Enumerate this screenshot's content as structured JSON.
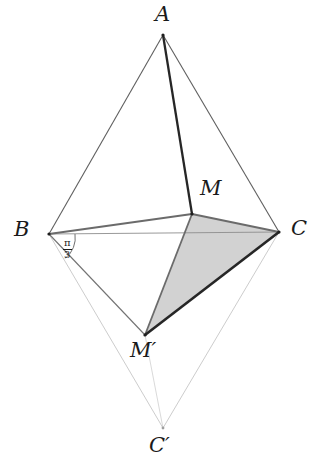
{
  "figure": {
    "type": "geometry-diagram",
    "title": "",
    "background_color": "#ffffff"
  },
  "labels": {
    "A": "A",
    "B": "B",
    "C": "C",
    "M": "M",
    "M_prime": "M′",
    "C_prime": "C′"
  },
  "angle": {
    "numerator": "π",
    "denominator": "3",
    "at_vertex": "B"
  },
  "points": {
    "A": {
      "x": 163,
      "y": 35
    },
    "B": {
      "x": 49,
      "y": 234
    },
    "C": {
      "x": 279,
      "y": 232
    },
    "M": {
      "x": 192,
      "y": 214
    },
    "Mp": {
      "x": 145,
      "y": 335
    },
    "Cp": {
      "x": 163,
      "y": 428
    }
  },
  "label_positions": {
    "A": {
      "x": 155,
      "y": 4
    },
    "B": {
      "x": 14,
      "y": 219
    },
    "C": {
      "x": 291,
      "y": 218
    },
    "M": {
      "x": 200,
      "y": 178
    },
    "Mp": {
      "x": 130,
      "y": 340
    },
    "Cp": {
      "x": 149,
      "y": 435
    },
    "frac": {
      "x": 63,
      "y": 238
    }
  },
  "colors": {
    "shade_fill": "#d2d2d2",
    "stroke_dark": "#262626",
    "stroke_mid": "#6e6e6e",
    "stroke_light": "#9a9a9a",
    "stroke_faint": "#c2c2c2",
    "text": "#1a1a1a"
  },
  "edges": [
    {
      "name": "A-B",
      "from": "A",
      "to": "B",
      "weight": "thin",
      "tone": "mid"
    },
    {
      "name": "A-C",
      "from": "A",
      "to": "C",
      "weight": "thin",
      "tone": "mid"
    },
    {
      "name": "A-M",
      "from": "A",
      "to": "M",
      "weight": "thick",
      "tone": "dark"
    },
    {
      "name": "B-C",
      "from": "B",
      "to": "C",
      "weight": "hair",
      "tone": "light"
    },
    {
      "name": "B-M",
      "from": "B",
      "to": "M",
      "weight": "medium",
      "tone": "mid"
    },
    {
      "name": "M-C",
      "from": "M",
      "to": "C",
      "weight": "medium",
      "tone": "mid"
    },
    {
      "name": "B-Mp",
      "from": "B",
      "to": "Mp",
      "weight": "thin",
      "tone": "mid"
    },
    {
      "name": "M-Mp",
      "from": "M",
      "to": "Mp",
      "weight": "medium",
      "tone": "mid"
    },
    {
      "name": "Mp-C",
      "from": "Mp",
      "to": "C",
      "weight": "thick",
      "tone": "dark"
    },
    {
      "name": "B-Cp",
      "from": "B",
      "to": "Cp",
      "weight": "hair",
      "tone": "faint"
    },
    {
      "name": "C-Cp",
      "from": "C",
      "to": "Cp",
      "weight": "hair",
      "tone": "faint"
    },
    {
      "name": "Mp-Cp",
      "from": "Mp",
      "to": "Cp",
      "weight": "hair",
      "tone": "faint"
    }
  ],
  "shaded_region": {
    "name": "triangle-M-C-Mprime",
    "vertices": [
      "M",
      "C",
      "Mp"
    ],
    "fill": "#d2d2d2"
  }
}
